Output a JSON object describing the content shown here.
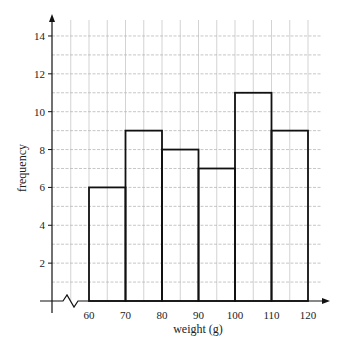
{
  "chart_data": {
    "type": "bar",
    "subtype": "histogram",
    "title": "",
    "xlabel": "weight (g)",
    "ylabel": "frequency",
    "categories": [
      "60-70",
      "70-80",
      "80-90",
      "90-100",
      "100-110",
      "110-120"
    ],
    "bin_edges": [
      60,
      70,
      80,
      90,
      100,
      110,
      120
    ],
    "values": [
      6,
      9,
      8,
      7,
      11,
      9
    ],
    "x_ticks": [
      "60",
      "70",
      "80",
      "90",
      "100",
      "110",
      "120"
    ],
    "y_ticks": [
      "2",
      "4",
      "6",
      "8",
      "10",
      "12",
      "14"
    ],
    "xlim": [
      50,
      125
    ],
    "ylim": [
      0,
      15
    ],
    "grid": true,
    "axis_break_on_x": true,
    "legend": null
  },
  "labels": {
    "xlabel": "weight (g)",
    "ylabel": "frequency"
  }
}
